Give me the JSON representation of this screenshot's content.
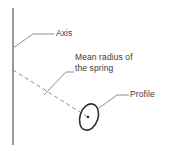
{
  "figure": {
    "type": "engineering-diagram",
    "background_color": "#ffffff",
    "line_color": "#808080",
    "outline_color": "#3b3b3b",
    "text_color": "#3b3b3b",
    "width": 169,
    "height": 151
  },
  "labels": {
    "axis": "Axis",
    "mean_radius_line1": "Mean radius of",
    "mean_radius_line2": "the spring",
    "profile": "Profile"
  },
  "geometry": {
    "axis_line": {
      "name": "spring axis",
      "x": 13,
      "y_top": 8,
      "y_bottom": 145,
      "style": "solid",
      "color": "#9a9a9a",
      "width": 1.2
    },
    "mean_radius_line": {
      "name": "mean radius of the spring",
      "from_x": 13,
      "from_y": 70,
      "to_x": 88,
      "to_y": 117,
      "style": "dashed",
      "color": "#8f8f8f",
      "dash": "4 3"
    },
    "profile_ellipse": {
      "name": "wire profile cross-section",
      "center_x": 89,
      "center_y": 117,
      "radius_x": 9,
      "radius_y": 13.5,
      "rotation_deg": 18,
      "stroke": "#2f2f2f",
      "stroke_width": 1.6,
      "fill": "none",
      "center_dot_radius": 1.3
    },
    "leader_axis": {
      "name": "leader line to Axis label",
      "points": "13,48 33,34 54,34",
      "color": "#8f8f8f"
    },
    "leader_mean_radius": {
      "name": "leader line to mean radius label",
      "points": "44,95 66,72 74,72",
      "color": "#8f8f8f"
    },
    "leader_profile": {
      "name": "leader line to Profile label",
      "points": "99,108 117,95 129,95",
      "color": "#8f8f8f"
    }
  }
}
